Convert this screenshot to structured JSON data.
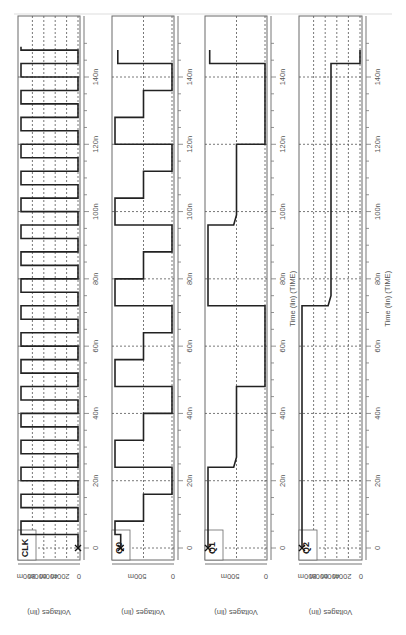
{
  "chart_data": [
    {
      "type": "line",
      "title": "CLK",
      "xlabel": "Time (lin) (TIME)",
      "ylabel": "Voltages (lin)",
      "x_ticks": [
        "0",
        "20n",
        "40n",
        "60n",
        "80n",
        "100n",
        "120n",
        "140n"
      ],
      "y_ticks": [
        "0",
        "200m",
        "400m",
        "600m",
        "800m"
      ],
      "ylim": [
        0,
        1.0
      ],
      "xlim_ns": [
        0,
        150
      ],
      "grid": true,
      "series": [
        {
          "name": "CLK",
          "points_ns_v": [
            [
              0,
              0
            ],
            [
              4,
              0
            ],
            [
              4,
              1
            ],
            [
              8,
              1
            ],
            [
              8,
              0
            ],
            [
              12,
              0
            ],
            [
              12,
              1
            ],
            [
              16,
              1
            ],
            [
              16,
              0
            ],
            [
              20,
              0
            ],
            [
              20,
              1
            ],
            [
              24,
              1
            ],
            [
              24,
              0
            ],
            [
              28,
              0
            ],
            [
              28,
              1
            ],
            [
              32,
              1
            ],
            [
              32,
              0
            ],
            [
              36,
              0
            ],
            [
              36,
              1
            ],
            [
              40,
              1
            ],
            [
              40,
              0
            ],
            [
              44,
              0
            ],
            [
              44,
              1
            ],
            [
              48,
              1
            ],
            [
              48,
              0
            ],
            [
              52,
              0
            ],
            [
              52,
              1
            ],
            [
              56,
              1
            ],
            [
              56,
              0
            ],
            [
              60,
              0
            ],
            [
              60,
              1
            ],
            [
              64,
              1
            ],
            [
              64,
              0
            ],
            [
              68,
              0
            ],
            [
              68,
              1
            ],
            [
              72,
              1
            ],
            [
              72,
              0
            ],
            [
              76,
              0
            ],
            [
              76,
              1
            ],
            [
              80,
              1
            ],
            [
              80,
              0
            ],
            [
              84,
              0
            ],
            [
              84,
              1
            ],
            [
              88,
              1
            ],
            [
              88,
              0
            ],
            [
              92,
              0
            ],
            [
              92,
              1
            ],
            [
              96,
              1
            ],
            [
              96,
              0
            ],
            [
              100,
              0
            ],
            [
              100,
              1
            ],
            [
              104,
              1
            ],
            [
              104,
              0
            ],
            [
              108,
              0
            ],
            [
              108,
              1
            ],
            [
              112,
              1
            ],
            [
              112,
              0
            ],
            [
              116,
              0
            ],
            [
              116,
              1
            ],
            [
              120,
              1
            ],
            [
              120,
              0
            ],
            [
              124,
              0
            ],
            [
              124,
              1
            ],
            [
              128,
              1
            ],
            [
              128,
              0
            ],
            [
              132,
              0
            ],
            [
              132,
              1
            ],
            [
              136,
              1
            ],
            [
              136,
              0
            ],
            [
              140,
              0
            ],
            [
              140,
              1
            ],
            [
              144,
              1
            ],
            [
              144,
              0
            ],
            [
              148,
              0
            ],
            [
              148,
              1
            ],
            [
              149,
              1
            ]
          ]
        }
      ]
    },
    {
      "type": "line",
      "title": "Q0",
      "xlabel": "Time (lin) (TIME)",
      "ylabel": "Voltages (lin)",
      "x_ticks": [
        "0",
        "20n",
        "40n",
        "60n",
        "80n",
        "100n",
        "120n",
        "140n"
      ],
      "y_ticks": [
        "0",
        "500m"
      ],
      "ylim": [
        0,
        1.0
      ],
      "xlim_ns": [
        0,
        150
      ],
      "grid": true,
      "series": [
        {
          "name": "Q0",
          "points_ns_v": [
            [
              0,
              0.9
            ],
            [
              4,
              0.9
            ],
            [
              4,
              1
            ],
            [
              8,
              1
            ],
            [
              8,
              0.5
            ],
            [
              16,
              0.5
            ],
            [
              16,
              0
            ],
            [
              24,
              0
            ],
            [
              24,
              1
            ],
            [
              32,
              1
            ],
            [
              32,
              0.5
            ],
            [
              40,
              0.5
            ],
            [
              40,
              0
            ],
            [
              48,
              0
            ],
            [
              48,
              1
            ],
            [
              56,
              1
            ],
            [
              56,
              0.5
            ],
            [
              64,
              0.5
            ],
            [
              64,
              0
            ],
            [
              72,
              0
            ],
            [
              72,
              1
            ],
            [
              80,
              1
            ],
            [
              80,
              0.5
            ],
            [
              88,
              0.5
            ],
            [
              88,
              0
            ],
            [
              96,
              0
            ],
            [
              96,
              1
            ],
            [
              104,
              1
            ],
            [
              104,
              0.5
            ],
            [
              112,
              0.5
            ],
            [
              112,
              0
            ],
            [
              120,
              0
            ],
            [
              120,
              1
            ],
            [
              128,
              1
            ],
            [
              128,
              0.5
            ],
            [
              136,
              0.5
            ],
            [
              136,
              0
            ],
            [
              144,
              0
            ],
            [
              144,
              0.95
            ],
            [
              148,
              0.95
            ]
          ]
        }
      ]
    },
    {
      "type": "line",
      "title": "Q1",
      "xlabel": "Time (lin) (TIME)",
      "ylabel": "Voltages (lin)",
      "x_ticks": [
        "0",
        "20n",
        "40n",
        "60n",
        "80n",
        "100n",
        "120n",
        "140n"
      ],
      "y_ticks": [
        "0",
        "500m"
      ],
      "ylim": [
        0,
        1.0
      ],
      "xlim_ns": [
        0,
        150
      ],
      "grid": true,
      "series": [
        {
          "name": "Q1",
          "points_ns_v": [
            [
              0,
              1
            ],
            [
              24,
              1
            ],
            [
              24,
              0.55
            ],
            [
              27,
              0.5
            ],
            [
              48,
              0.5
            ],
            [
              48,
              0
            ],
            [
              72,
              0
            ],
            [
              72,
              1
            ],
            [
              96,
              1
            ],
            [
              96,
              0.55
            ],
            [
              99,
              0.5
            ],
            [
              120,
              0.5
            ],
            [
              120,
              0
            ],
            [
              144,
              0
            ],
            [
              144,
              0.97
            ],
            [
              148,
              0.97
            ]
          ]
        }
      ]
    },
    {
      "type": "line",
      "title": "Q2",
      "xlabel": "Time (lin) (TIME)",
      "ylabel": "Voltages (lin)",
      "x_ticks": [
        "0",
        "20n",
        "40n",
        "60n",
        "80n",
        "100n",
        "120n",
        "140n"
      ],
      "y_ticks": [
        "0",
        "200m",
        "400m",
        "600m",
        "800m"
      ],
      "ylim": [
        0,
        1.0
      ],
      "xlim_ns": [
        0,
        150
      ],
      "grid": true,
      "series": [
        {
          "name": "Q2",
          "points_ns_v": [
            [
              0,
              1
            ],
            [
              72,
              1
            ],
            [
              72,
              0.55
            ],
            [
              75,
              0.5
            ],
            [
              144,
              0.5
            ],
            [
              144,
              0
            ],
            [
              148,
              0
            ]
          ]
        }
      ]
    }
  ],
  "panels": [
    {
      "name": "CLK",
      "signal_label": "CLK",
      "ylabel": "Voltages (lin)",
      "xlabel": "",
      "yticks": [
        "800m",
        "600m",
        "400m",
        "200m",
        "0"
      ],
      "x0": 18,
      "x1": 80
    },
    {
      "name": "Q0",
      "signal_label": "Q0",
      "ylabel": "Voltages (lin)",
      "xlabel": "",
      "yticks": [
        "500m",
        "0"
      ],
      "x0": 112,
      "x1": 174
    },
    {
      "name": "Q1",
      "signal_label": "Q1",
      "ylabel": "Voltages (lin)",
      "xlabel": "Time (lin) (TIME)",
      "yticks": [
        "500m",
        "0"
      ],
      "x0": 205,
      "x1": 267
    },
    {
      "name": "Q2",
      "signal_label": "Q2",
      "ylabel": "Voltages (lin)",
      "xlabel": "Time (lin) (TIME)",
      "yticks": [
        "800m",
        "600m",
        "400m",
        "200m",
        "0"
      ],
      "x0": 299,
      "x1": 362
    }
  ],
  "time_ticks": [
    "0",
    "20n",
    "40n",
    "60n",
    "80n",
    "100n",
    "120n",
    "140n"
  ],
  "xlabel_text": "Time (lin) (TIME)",
  "colors": {
    "wave": "#222222",
    "grid": "#555555",
    "frame": "#6a6a6a"
  }
}
